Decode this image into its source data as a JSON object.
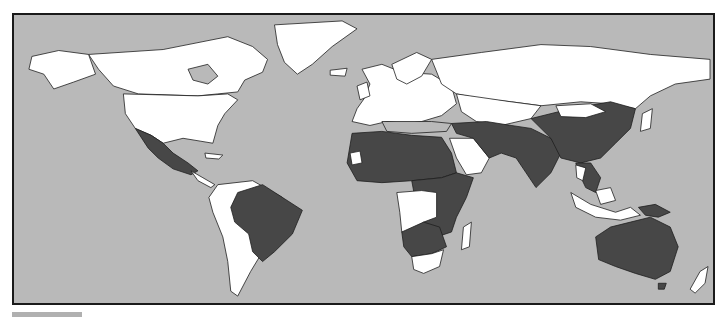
{
  "map": {
    "type": "choropleth-world-map",
    "projection": "equirectangular",
    "colors": {
      "ocean": "#b9b9b9",
      "highlighted": "#474747",
      "not_highlighted": "#ffffff",
      "other_gray": "#b9b9b9",
      "border": "#1e1e1e"
    },
    "highlighted_regions": [
      "Mexico",
      "Brazil",
      "Northern Africa",
      "Western Africa",
      "Central Africa",
      "Eastern Africa",
      "Southern Africa (part)",
      "Middle East (part)",
      "Iran",
      "Afghanistan",
      "Pakistan",
      "India",
      "China",
      "Southeast Asia (part)",
      "Papua New Guinea",
      "Australia"
    ],
    "white_regions": [
      "Canada",
      "United States",
      "Greenland",
      "Russia",
      "Europe",
      "South America (most)",
      "Saudi Arabia",
      "Angola",
      "DR Congo",
      "South Africa",
      "Madagascar",
      "Indonesia",
      "New Zealand",
      "Japan",
      "Mongolia",
      "Kazakhstan"
    ]
  },
  "legend": {
    "swatch_color": "#b0b0b0",
    "text": ""
  }
}
